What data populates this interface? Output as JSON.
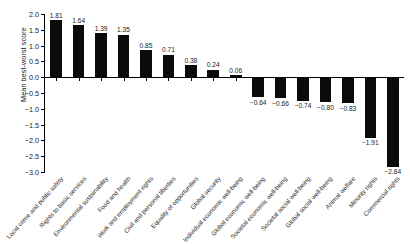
{
  "chart_data": {
    "type": "bar",
    "title": "",
    "xlabel": "",
    "ylabel": "Mean best-worst score",
    "ylim": [
      -3.0,
      2.0
    ],
    "grid": false,
    "legend": null,
    "orientation": "vertical",
    "bar_color": "#0b0b0b",
    "yticks": [
      "2.0",
      "1.5",
      "1.0",
      "0.5",
      "0.0",
      "-0.5",
      "-1.0",
      "-1.5",
      "-2.0",
      "-2.5",
      "-3.0"
    ],
    "ytick_values": [
      2.0,
      1.5,
      1.0,
      0.5,
      0.0,
      -0.5,
      -1.0,
      -1.5,
      -2.0,
      -2.5,
      -3.0
    ],
    "categories": [
      "Local crime and public safety",
      "Rights to basic services",
      "Environmental sustainability",
      "Food and health",
      "Work and employment rights",
      "Civil and personal liberties",
      "Equality of opportunities",
      "Global security",
      "Individual economic well-being",
      "Global economic well-being",
      "Societal economic well-being",
      "Societal social well-being",
      "Global social well-being",
      "Animal welfare",
      "Minority rights",
      "Commercial rights"
    ],
    "values": [
      1.81,
      1.64,
      1.39,
      1.35,
      0.85,
      0.71,
      0.38,
      0.24,
      0.06,
      -0.64,
      -0.66,
      -0.74,
      -0.8,
      -0.83,
      -1.91,
      -2.84
    ],
    "value_labels": [
      "1.81",
      "1.64",
      "1.39",
      "1.35",
      "0.85",
      "0.71",
      "0.38",
      "0.24",
      "0.06",
      "-0.64",
      "-0.66",
      "-0.74",
      "-0.80",
      "-0.83",
      "-1.91",
      "-2.84"
    ]
  }
}
